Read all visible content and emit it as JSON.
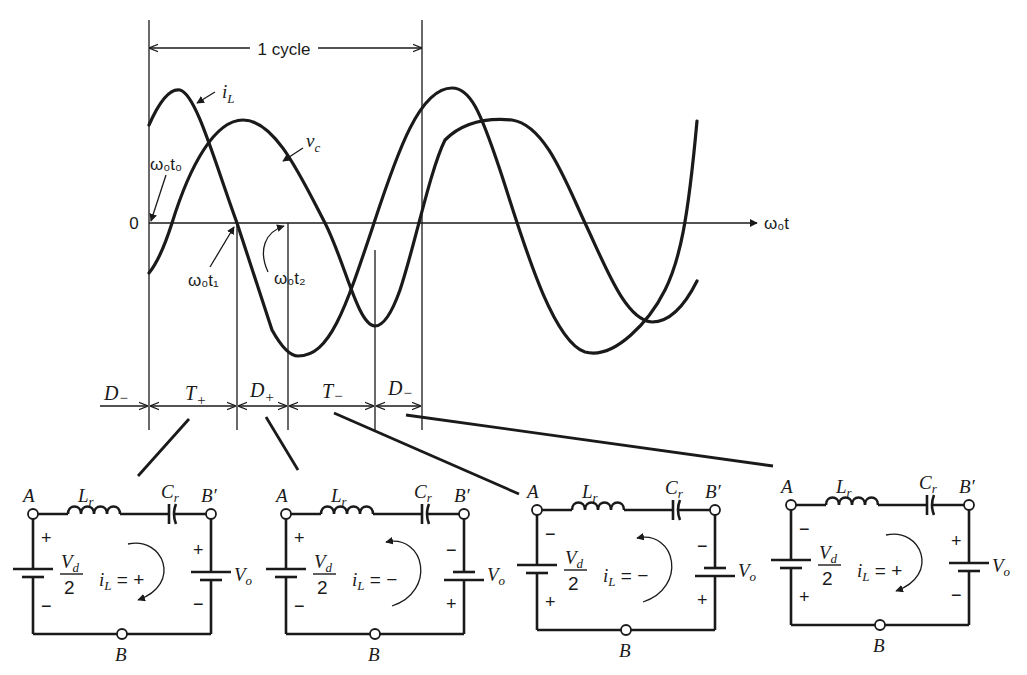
{
  "figure": {
    "cycle_label": "1 cycle",
    "axis": {
      "origin_label": "0",
      "x_label": "ω₀t"
    },
    "waveforms": [
      {
        "name": "iL",
        "label": "i",
        "label_sub": "L"
      },
      {
        "name": "vc",
        "label": "v",
        "label_sub": "c"
      }
    ],
    "time_markers": [
      {
        "label": "ω₀t₀"
      },
      {
        "label": "ω₀t₁"
      },
      {
        "label": "ω₀t₂"
      }
    ],
    "intervals": [
      {
        "label": "D",
        "sub": "−"
      },
      {
        "label": "T",
        "sub": "+"
      },
      {
        "label": "D",
        "sub": "+"
      },
      {
        "label": "T",
        "sub": "−"
      },
      {
        "label": "D",
        "sub": "−"
      }
    ]
  },
  "circuits": [
    {
      "node_a": "A",
      "node_b": "B",
      "node_bp": "B′",
      "inductor": "L",
      "inductor_sub": "r",
      "capacitor": "C",
      "capacitor_sub": "r",
      "vd_num": "V",
      "vd_sub": "d",
      "vd_den": "2",
      "vd_top_sign": "+",
      "vd_bottom_sign": "−",
      "vo": "V",
      "vo_sub": "o",
      "vo_top_sign": "+",
      "vo_bottom_sign": "−",
      "current_label": "i",
      "current_sub": "L",
      "current_eq": "= +",
      "current_direction": "clockwise"
    },
    {
      "node_a": "A",
      "node_b": "B",
      "node_bp": "B′",
      "inductor": "L",
      "inductor_sub": "r",
      "capacitor": "C",
      "capacitor_sub": "r",
      "vd_num": "V",
      "vd_sub": "d",
      "vd_den": "2",
      "vd_top_sign": "+",
      "vd_bottom_sign": "−",
      "vo": "V",
      "vo_sub": "o",
      "vo_top_sign": "−",
      "vo_bottom_sign": "+",
      "current_label": "i",
      "current_sub": "L",
      "current_eq": "= −",
      "current_direction": "counterclockwise"
    },
    {
      "node_a": "A",
      "node_b": "B",
      "node_bp": "B′",
      "inductor": "L",
      "inductor_sub": "r",
      "capacitor": "C",
      "capacitor_sub": "r",
      "vd_num": "V",
      "vd_sub": "d",
      "vd_den": "2",
      "vd_top_sign": "−",
      "vd_bottom_sign": "+",
      "vo": "V",
      "vo_sub": "o",
      "vo_top_sign": "−",
      "vo_bottom_sign": "+",
      "current_label": "i",
      "current_sub": "L",
      "current_eq": "= −",
      "current_direction": "counterclockwise"
    },
    {
      "node_a": "A",
      "node_b": "B",
      "node_bp": "B′",
      "inductor": "L",
      "inductor_sub": "r",
      "capacitor": "C",
      "capacitor_sub": "r",
      "vd_num": "V",
      "vd_sub": "d",
      "vd_den": "2",
      "vd_top_sign": "−",
      "vd_bottom_sign": "+",
      "vo": "V",
      "vo_sub": "o",
      "vo_top_sign": "+",
      "vo_bottom_sign": "−",
      "current_label": "i",
      "current_sub": "L",
      "current_eq": "= +",
      "current_direction": "clockwise"
    }
  ]
}
